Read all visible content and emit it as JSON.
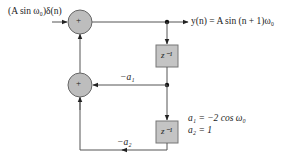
{
  "diagram": {
    "input_label": "(A sin ω₀)δ(n)",
    "output_label": "y(n) = A sin (n + 1)ω₀",
    "adder_symbol": "+",
    "delay_label": "z⁻¹",
    "gain_a1": "−a₁",
    "gain_a2": "−a₂",
    "coeff_a1": "a₁ = −2 cos ω₀",
    "coeff_a2": "a₂ = 1",
    "colors": {
      "line": "#555555",
      "node_fill": "#bdbdbd",
      "node_stroke": "#666666",
      "box_fill": "#c4c4c4",
      "text": "#222222"
    }
  }
}
